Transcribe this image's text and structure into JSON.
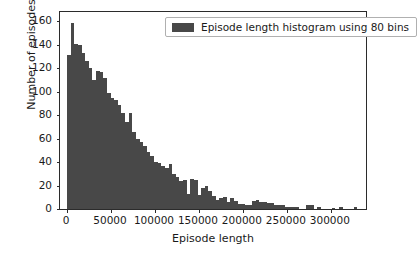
{
  "chart_data": {
    "type": "bar",
    "title": "",
    "xlabel": "Episode length",
    "ylabel": "Number of episodes",
    "xlim": [
      -8000,
      340000
    ],
    "ylim": [
      0,
      168
    ],
    "grid": false,
    "legend_position": "upper right",
    "bin_count": 80,
    "bar_color": "#484848",
    "series": [
      {
        "name": "Episode length histogram using 80 bins",
        "bin_width": 4125,
        "bin_starts": [
          0,
          4125,
          8250,
          12375,
          16500,
          20625,
          24750,
          28875,
          33000,
          37125,
          41250,
          45375,
          49500,
          53625,
          57750,
          61875,
          66000,
          70125,
          74250,
          78375,
          82500,
          86625,
          90750,
          94875,
          99000,
          103125,
          107250,
          111375,
          115500,
          119625,
          123750,
          127875,
          132000,
          136125,
          140250,
          144375,
          148500,
          152625,
          156750,
          160875,
          165000,
          169125,
          173250,
          177375,
          181500,
          185625,
          189750,
          193875,
          198000,
          202125,
          206250,
          210375,
          214500,
          218625,
          222750,
          226875,
          231000,
          235125,
          239250,
          243375,
          247500,
          251625,
          255750,
          259875,
          264000,
          268125,
          272250,
          276375,
          280500,
          284625,
          288750,
          292875,
          297000,
          301125,
          305250,
          309375,
          313500,
          317625,
          321750,
          325875
        ],
        "values": [
          131,
          159,
          141,
          140,
          133,
          126,
          120,
          110,
          118,
          117,
          112,
          99,
          95,
          93,
          89,
          82,
          74,
          82,
          66,
          60,
          57,
          54,
          49,
          45,
          40,
          39,
          37,
          35,
          38,
          30,
          27,
          24,
          25,
          13,
          26,
          25,
          12,
          18,
          20,
          15,
          11,
          8,
          9,
          10,
          6,
          9,
          7,
          4,
          4,
          3,
          3,
          7,
          8,
          6,
          6,
          5,
          5,
          3,
          3,
          3,
          2,
          2,
          2,
          2,
          0,
          0,
          3,
          3,
          0,
          2,
          0,
          0,
          0,
          1,
          0,
          2,
          0,
          0,
          0,
          2
        ]
      }
    ],
    "xticks": [
      0,
      50000,
      100000,
      150000,
      200000,
      250000,
      300000
    ],
    "xticklabels": [
      "0",
      "50000",
      "100000",
      "150000",
      "200000",
      "250000",
      "300000"
    ],
    "yticks": [
      0,
      20,
      40,
      60,
      80,
      100,
      120,
      140,
      160
    ],
    "yticklabels": [
      "0",
      "20",
      "40",
      "60",
      "80",
      "100",
      "120",
      "140",
      "160"
    ]
  },
  "legend": {
    "label": "Episode length histogram using 80 bins",
    "swatch_color": "#484848"
  }
}
